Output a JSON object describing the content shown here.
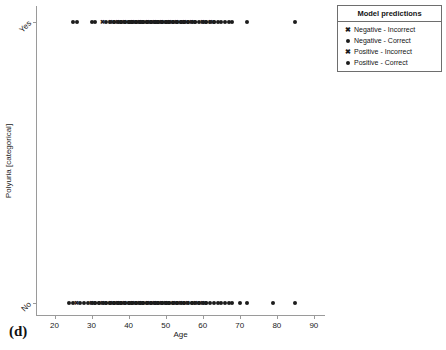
{
  "panel": {
    "tag": "(d)"
  },
  "legend": {
    "title": "Model predictions",
    "entries": [
      {
        "marker": "cross",
        "glyph": "✖",
        "label": "Negative - Incorrect"
      },
      {
        "marker": "dot",
        "glyph": "●",
        "label": "Negative - Correct"
      },
      {
        "marker": "cross",
        "glyph": "✖",
        "label": "Positive - Incorrect"
      },
      {
        "marker": "dot",
        "glyph": "●",
        "label": "Positive - Correct"
      }
    ]
  },
  "chart_data": {
    "type": "scatter",
    "title": "",
    "xlabel": "Age",
    "ylabel": "Polyuria [categorical]",
    "xlim": [
      15,
      93
    ],
    "xticks": [
      20,
      30,
      40,
      50,
      60,
      70,
      80,
      90
    ],
    "xtick_labels": [
      "20",
      "30",
      "40",
      "50",
      "60",
      "70",
      "80",
      "90"
    ],
    "ycategories": [
      "No",
      "Yes"
    ],
    "ytick_labels": [
      "No",
      "Yes"
    ],
    "grid": false,
    "legend_position": "outside-top-right",
    "marker_color": "#1c1c1c",
    "series": [
      {
        "name": "Yes",
        "y": "Yes",
        "x": [
          25,
          26,
          30,
          31,
          33,
          34,
          35,
          35,
          36,
          36,
          37,
          37,
          38,
          38,
          38,
          39,
          39,
          39,
          40,
          40,
          40,
          40,
          41,
          41,
          41,
          41,
          42,
          42,
          42,
          42,
          43,
          43,
          43,
          43,
          44,
          44,
          44,
          44,
          45,
          45,
          45,
          45,
          46,
          46,
          46,
          46,
          47,
          47,
          47,
          47,
          48,
          48,
          48,
          48,
          49,
          49,
          49,
          49,
          50,
          50,
          50,
          50,
          51,
          51,
          51,
          52,
          52,
          52,
          53,
          53,
          53,
          54,
          54,
          54,
          55,
          55,
          55,
          56,
          56,
          57,
          57,
          58,
          58,
          59,
          60,
          60,
          61,
          61,
          62,
          62,
          63,
          63,
          64,
          65,
          66,
          67,
          68,
          72,
          85
        ],
        "markers": [
          "dot",
          "dot",
          "dot",
          "dot",
          "cross",
          "dot",
          "dot",
          "cross",
          "dot",
          "dot",
          "dot",
          "cross",
          "dot",
          "dot",
          "dot",
          "dot",
          "dot",
          "cross",
          "dot",
          "dot",
          "dot",
          "dot",
          "dot",
          "dot",
          "dot",
          "cross",
          "dot",
          "dot",
          "dot",
          "dot",
          "dot",
          "dot",
          "dot",
          "cross",
          "dot",
          "dot",
          "dot",
          "dot",
          "dot",
          "dot",
          "cross",
          "dot",
          "dot",
          "dot",
          "dot",
          "dot",
          "dot",
          "dot",
          "dot",
          "cross",
          "dot",
          "dot",
          "dot",
          "dot",
          "dot",
          "dot",
          "cross",
          "dot",
          "dot",
          "dot",
          "dot",
          "dot",
          "dot",
          "dot",
          "cross",
          "dot",
          "dot",
          "dot",
          "dot",
          "cross",
          "dot",
          "dot",
          "dot",
          "dot",
          "dot",
          "cross",
          "dot",
          "dot",
          "dot",
          "dot",
          "cross",
          "dot",
          "dot",
          "dot",
          "dot",
          "cross",
          "dot",
          "dot",
          "dot",
          "cross",
          "dot",
          "dot",
          "dot",
          "dot",
          "dot",
          "dot",
          "dot",
          "dot",
          "dot"
        ]
      },
      {
        "name": "No",
        "y": "No",
        "x": [
          24,
          25,
          26,
          27,
          28,
          29,
          30,
          30,
          31,
          31,
          32,
          32,
          33,
          33,
          34,
          34,
          35,
          35,
          35,
          36,
          36,
          36,
          37,
          37,
          37,
          38,
          38,
          38,
          39,
          39,
          39,
          40,
          40,
          40,
          41,
          41,
          41,
          42,
          42,
          42,
          43,
          43,
          43,
          44,
          44,
          44,
          45,
          45,
          45,
          46,
          46,
          46,
          47,
          47,
          47,
          48,
          48,
          48,
          49,
          49,
          49,
          50,
          50,
          50,
          51,
          51,
          51,
          52,
          52,
          52,
          53,
          53,
          53,
          54,
          54,
          55,
          55,
          56,
          56,
          57,
          57,
          58,
          58,
          59,
          59,
          60,
          60,
          61,
          61,
          62,
          63,
          64,
          65,
          66,
          67,
          68,
          70,
          72,
          79,
          85
        ],
        "markers": [
          "dot",
          "dot",
          "cross",
          "dot",
          "dot",
          "dot",
          "dot",
          "cross",
          "dot",
          "dot",
          "dot",
          "dot",
          "dot",
          "cross",
          "dot",
          "dot",
          "dot",
          "dot",
          "cross",
          "dot",
          "dot",
          "dot",
          "dot",
          "cross",
          "dot",
          "dot",
          "dot",
          "dot",
          "dot",
          "cross",
          "dot",
          "dot",
          "dot",
          "dot",
          "dot",
          "cross",
          "dot",
          "dot",
          "dot",
          "dot",
          "dot",
          "cross",
          "dot",
          "dot",
          "dot",
          "dot",
          "cross",
          "dot",
          "dot",
          "dot",
          "dot",
          "dot",
          "cross",
          "dot",
          "dot",
          "dot",
          "dot",
          "dot",
          "cross",
          "dot",
          "dot",
          "dot",
          "dot",
          "cross",
          "dot",
          "dot",
          "dot",
          "dot",
          "cross",
          "dot",
          "dot",
          "dot",
          "dot",
          "dot",
          "cross",
          "dot",
          "dot",
          "dot",
          "cross",
          "dot",
          "dot",
          "dot",
          "cross",
          "dot",
          "dot",
          "dot",
          "cross",
          "dot",
          "dot",
          "dot",
          "dot",
          "dot",
          "dot",
          "dot",
          "dot",
          "dot",
          "dot",
          "dot",
          "dot",
          "dot"
        ]
      }
    ]
  }
}
